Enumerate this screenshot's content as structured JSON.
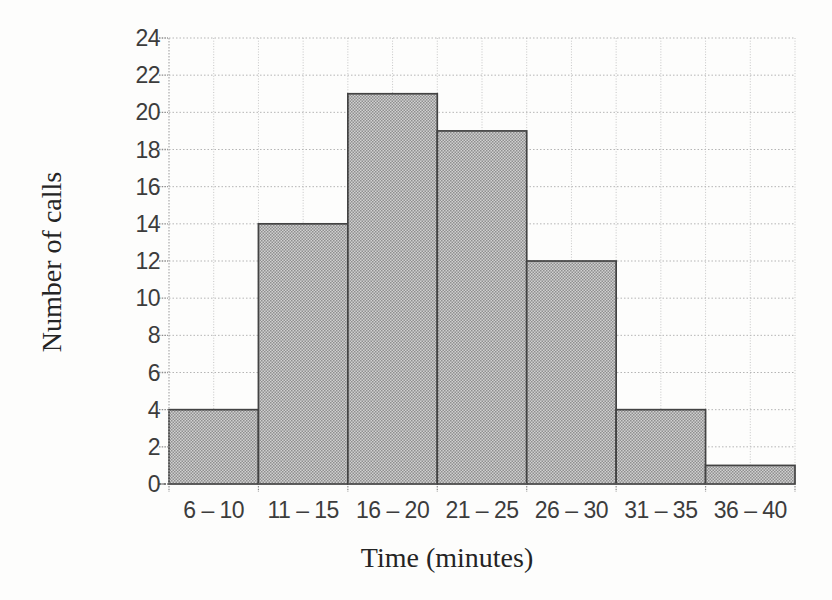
{
  "chart_data": {
    "type": "bar",
    "subtype": "histogram",
    "title": "",
    "categories": [
      "6 – 10",
      "11 – 15",
      "16 – 20",
      "21 – 25",
      "26 – 30",
      "31 – 35",
      "36 – 40"
    ],
    "values": [
      4,
      14,
      21,
      19,
      12,
      4,
      1
    ],
    "xlabel": "Time (minutes)",
    "ylabel": "Number of calls",
    "ylim": [
      0,
      24
    ],
    "ytick_step": 2,
    "yticks": [
      0,
      2,
      4,
      6,
      8,
      10,
      12,
      14,
      16,
      18,
      20,
      22,
      24
    ],
    "grid": "both",
    "legend": "none",
    "colors": {
      "background": "#fdfdfc",
      "bar_fill_average": "#b0b0b0",
      "bar_texture_light": "#d0d0d0",
      "bar_texture_dark": "#8f8f8f",
      "bar_border": "#434343",
      "grid_vertical": "#c6c6c6",
      "grid_horizontal": "#b5b5b5",
      "y_axis_line": "#ababab",
      "x_axis_line": "#5f5f5f",
      "tick_mark": "#8d8d8d",
      "tick_text": "#3c3c3c",
      "title_text": "#242424"
    }
  }
}
